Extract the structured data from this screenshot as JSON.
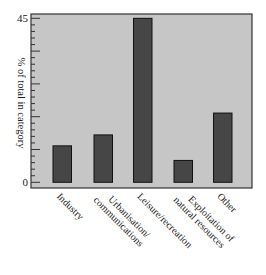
{
  "chart_data": {
    "type": "bar",
    "title": "",
    "xlabel": "",
    "ylabel": "% of total in category",
    "categories": [
      [
        "Industry"
      ],
      [
        "Urbanisation/",
        "communications"
      ],
      [
        "Leisure/recreation"
      ],
      [
        "Exploitation of",
        "natural resources"
      ],
      [
        "Other"
      ]
    ],
    "category_names": [
      "Industry",
      "Urbanisation/communications",
      "Leisure/recreation",
      "Exploitation of natural resources",
      "Other"
    ],
    "values": [
      10,
      13,
      45,
      6,
      19
    ],
    "ylim": [
      0,
      45
    ],
    "yticks_labeled": [
      0,
      45
    ],
    "major_tick_step": 9,
    "minor_subdivisions": 5,
    "grid": false,
    "legend": null,
    "x_label_rotation": 45
  },
  "colors": {
    "plot_background": "#c6c6c6",
    "bar_fill": "#464646",
    "bar_outline": "#111111",
    "axis": "#333333"
  }
}
